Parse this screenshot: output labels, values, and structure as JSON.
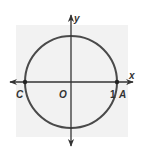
{
  "diagram": {
    "type": "unit-circle",
    "background_square": {
      "x": 16,
      "y": 25,
      "width": 112,
      "height": 112,
      "color": "#f2f2f2"
    },
    "origin": {
      "cx": 71,
      "cy": 82
    },
    "radius": 47,
    "line_color": "#4a4a4a",
    "axis_color": "#333333",
    "axes": {
      "x_label": "x",
      "y_label": "y"
    },
    "points": [
      {
        "name": "C",
        "label": "C",
        "coords": [
          -1,
          0
        ]
      },
      {
        "name": "O",
        "label": "O",
        "coords": [
          0,
          0
        ]
      },
      {
        "name": "A",
        "label": "A",
        "coords": [
          1,
          0
        ]
      }
    ],
    "tick_label": "1"
  }
}
